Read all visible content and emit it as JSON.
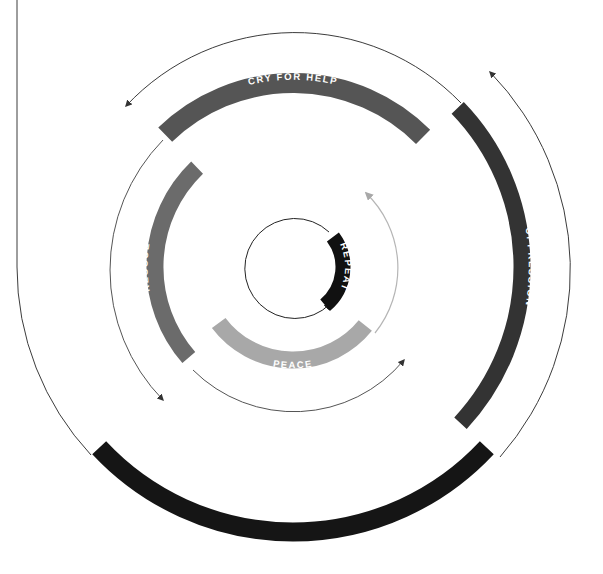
{
  "diagram": {
    "center": {
      "x": 293,
      "y": 267
    },
    "colors": {
      "background": "#ffffff",
      "black": "#141414",
      "dark_gray": "#3a3a3a",
      "mid_gray": "#5c5c5c",
      "gray": "#6e6e6e",
      "light_gray": "#a9a9a9",
      "line": "#3c3c3c",
      "line_light": "#b5b5b5",
      "label_text": "#ffffff"
    },
    "stages": [
      {
        "id": "cry-for-help",
        "label": "CRY FOR HELP",
        "radius": 184,
        "start_deg": -134,
        "end_deg": -45,
        "thickness": 20,
        "color": "#555555"
      },
      {
        "id": "oppression",
        "label": "OPPRESSION",
        "radius": 229,
        "start_deg": -44,
        "end_deg": 43,
        "thickness": 17,
        "color": "#333333"
      },
      {
        "id": "rebellion",
        "label": "REBELLION",
        "radius": 265,
        "start_deg": 43,
        "end_deg": 137,
        "thickness": 19,
        "color": "#151515"
      },
      {
        "id": "rescue",
        "label": "RESCUE",
        "radius": 138,
        "start_deg": 139,
        "end_deg": 226,
        "thickness": 17,
        "color": "#6b6b6b"
      },
      {
        "id": "peace",
        "label": "PEACE",
        "radius": 93,
        "start_deg": 39,
        "end_deg": 143,
        "thickness": 17,
        "color": "#a8a8a8"
      },
      {
        "id": "repeat",
        "label": "REPEAT",
        "radius": 50,
        "start_deg": -37,
        "end_deg": 50,
        "thickness": 15,
        "color": "#111111"
      }
    ],
    "labels": {
      "cry_for_help": "CRY FOR HELP",
      "oppression": "OPPRESSION",
      "rebellion": "REBELLION",
      "rescue": "RESCUE",
      "peace": "PEACE",
      "repeat": "REPEAT"
    }
  }
}
